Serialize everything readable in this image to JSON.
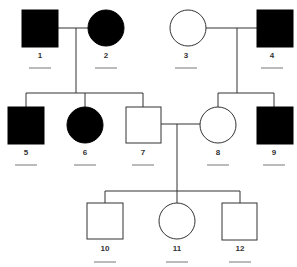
{
  "diagram": {
    "type": "pedigree",
    "colors": {
      "affected": "#000000",
      "unaffected": "#ffffff",
      "line": "#333333"
    },
    "individuals": [
      {
        "id": "1",
        "label": "1",
        "sex": "male",
        "affected": true,
        "generation": 1
      },
      {
        "id": "2",
        "label": "2",
        "sex": "female",
        "affected": true,
        "generation": 1
      },
      {
        "id": "3",
        "label": "3",
        "sex": "female",
        "affected": false,
        "generation": 1
      },
      {
        "id": "4",
        "label": "4",
        "sex": "male",
        "affected": true,
        "generation": 1
      },
      {
        "id": "5",
        "label": "5",
        "sex": "male",
        "affected": true,
        "generation": 2
      },
      {
        "id": "6",
        "label": "6",
        "sex": "female",
        "affected": true,
        "generation": 2
      },
      {
        "id": "7",
        "label": "7",
        "sex": "male",
        "affected": false,
        "generation": 2
      },
      {
        "id": "8",
        "label": "8",
        "sex": "female",
        "affected": false,
        "generation": 2
      },
      {
        "id": "9",
        "label": "9",
        "sex": "male",
        "affected": true,
        "generation": 2
      },
      {
        "id": "10",
        "label": "10",
        "sex": "male",
        "affected": false,
        "generation": 3
      },
      {
        "id": "11",
        "label": "11",
        "sex": "female",
        "affected": false,
        "generation": 3
      },
      {
        "id": "12",
        "label": "12",
        "sex": "male",
        "affected": false,
        "generation": 3
      }
    ],
    "matings": [
      [
        "1",
        "2"
      ],
      [
        "3",
        "4"
      ],
      [
        "7",
        "8"
      ]
    ],
    "offspring": {
      "1x2": [
        "5",
        "6",
        "7"
      ],
      "3x4": [
        "8",
        "9"
      ],
      "7x8": [
        "10",
        "11",
        "12"
      ]
    }
  }
}
